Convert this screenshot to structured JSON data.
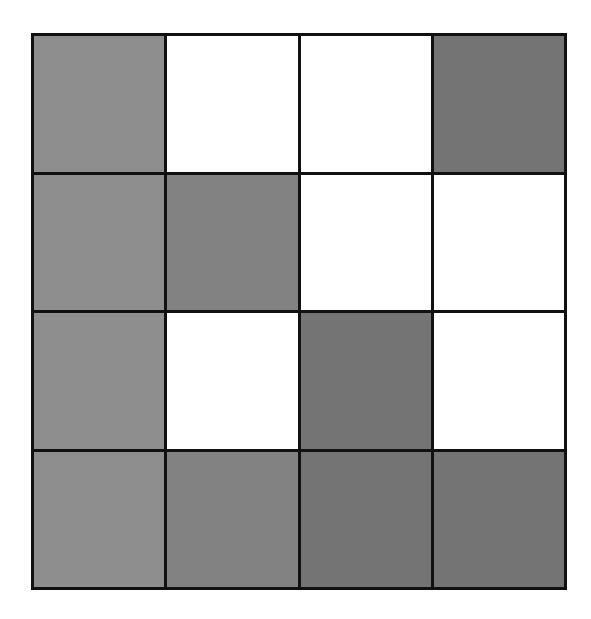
{
  "grid": {
    "rows": 4,
    "cols": 4,
    "border_color": "#111111",
    "palette": {
      "white": "#ffffff",
      "gray": "#8e8e8e",
      "mid": "#828282",
      "dark": "#747474"
    },
    "cells": [
      [
        "gray",
        "white",
        "white",
        "dark"
      ],
      [
        "gray",
        "mid",
        "white",
        "white"
      ],
      [
        "gray",
        "white",
        "dark",
        "white"
      ],
      [
        "gray",
        "mid",
        "dark",
        "dark"
      ]
    ]
  }
}
